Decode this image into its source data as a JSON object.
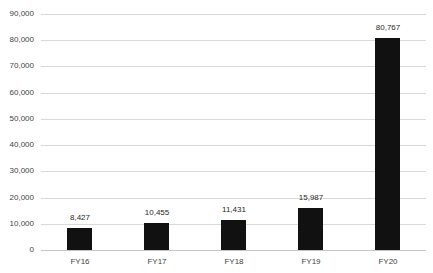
{
  "chart_data": {
    "type": "bar",
    "title": "",
    "xlabel": "",
    "ylabel": "",
    "categories": [
      "FY16",
      "FY17",
      "FY18",
      "FY19",
      "FY20"
    ],
    "values": [
      8427,
      10455,
      11431,
      15987,
      80767
    ],
    "value_labels": [
      "8,427",
      "10,455",
      "11,431",
      "15,987",
      "80,767"
    ],
    "ylim": [
      0,
      90000
    ],
    "yticks": [
      0,
      10000,
      20000,
      30000,
      40000,
      50000,
      60000,
      70000,
      80000,
      90000
    ],
    "ytick_labels": [
      "0",
      "10,000",
      "20,000",
      "30,000",
      "40,000",
      "50,000",
      "60,000",
      "70,000",
      "80,000",
      "90,000"
    ],
    "grid": true,
    "legend": "none"
  },
  "colors": {
    "background": "#ffffff",
    "bar": "#111111",
    "gridline": "#d9d9d9",
    "axis_line": "#c6c6c6",
    "ytick_label": "#3f3f3f",
    "xtick_label": "#3f3f3f",
    "value_label": "#1f1f1f"
  }
}
